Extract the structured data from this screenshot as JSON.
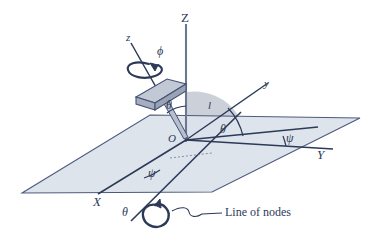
{
  "figure": {
    "type": "line-diagram",
    "colors": {
      "ink": "#2c3a58",
      "plane_fill": "#dde3ec",
      "plane_stroke": "#44527a",
      "sector_fill": "#b9bfca",
      "block_top": "#c3c9d4",
      "block_side": "#9aa3b4",
      "background": "#ffffff"
    }
  },
  "labels": {
    "axis_Z": "Z",
    "axis_Y": "Y",
    "axis_X": "X",
    "axis_z_body": "z",
    "axis_y_body": "y",
    "angle_phi": "ϕ",
    "angle_theta_upper": "θ",
    "angle_theta_lower": "θ",
    "angle_theta_nodes": "θ",
    "angle_psi_right": "ψ",
    "angle_psi_left": "ψ",
    "length_l": "l",
    "origin_O": "O",
    "line_of_nodes": "Line of nodes"
  },
  "elements": {
    "plane": "horizontal-reference-plane",
    "sector": "shaded-angle-sector",
    "block": "tilted-rigid-body-slab",
    "spin_arrow_phi": "phi-rotation-arrow",
    "spin_arrow_theta": "theta-rotation-arrow",
    "leader_line": "line-of-nodes-leader"
  },
  "geometry": {
    "origin": [
      186,
      140
    ],
    "plane_corners": [
      [
        150,
        115
      ],
      [
        360,
        118
      ],
      [
        212,
        192
      ],
      [
        22,
        193
      ]
    ],
    "Z_axis_top": [
      186,
      24
    ],
    "Y_axis_end": [
      333,
      149
    ],
    "X_axis_end": [
      98,
      194
    ],
    "y_body_end": [
      268,
      83
    ],
    "z_body_end": [
      131,
      43
    ],
    "nodes_line_from": [
      131,
      221
    ],
    "nodes_line_to": [
      241,
      112
    ]
  }
}
